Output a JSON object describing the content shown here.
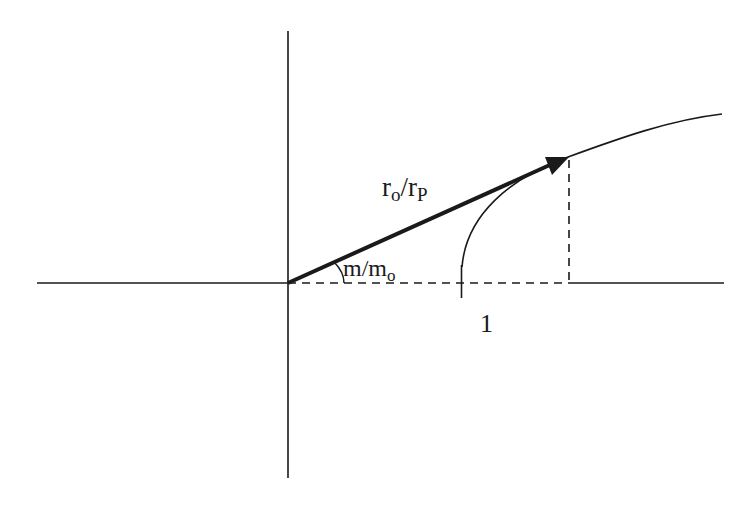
{
  "diagram": {
    "labels": {
      "vector_main": "r",
      "vector_sub_num": "o",
      "vector_slash": "/r",
      "vector_sub_den": "P",
      "angle_main": "m/m",
      "angle_sub": "o",
      "unit_tick": "1"
    },
    "colors": {
      "stroke": "#1a1a1a",
      "background": "#ffffff"
    }
  }
}
